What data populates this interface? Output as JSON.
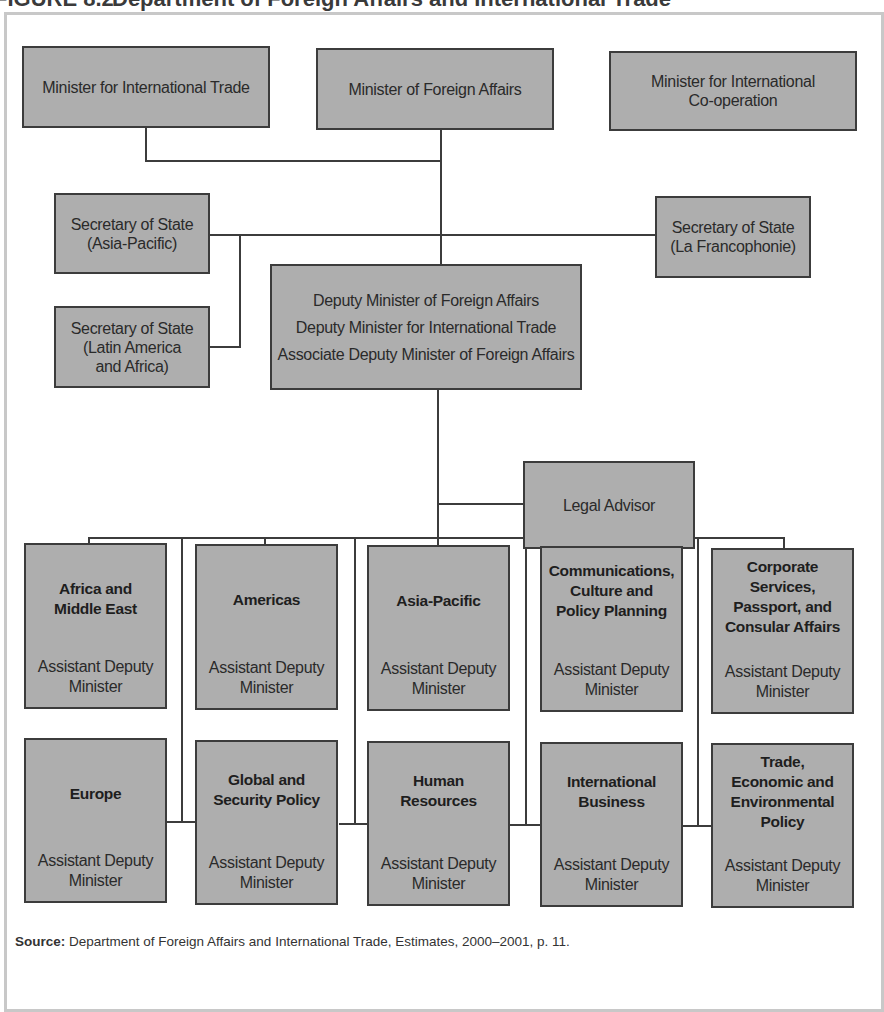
{
  "figure": {
    "number": "FIGURE 8.2",
    "title": "Department of Foreign Affairs and International Trade"
  },
  "ministers": [
    {
      "label": "Minister for International Trade"
    },
    {
      "label": "Minister of Foreign Affairs"
    },
    {
      "label_lines": [
        "Minister for International",
        "Co-operation"
      ]
    }
  ],
  "secretaries": [
    {
      "label_lines": [
        "Secretary of State",
        "(Asia-Pacific)"
      ]
    },
    {
      "label_lines": [
        "Secretary of State",
        "(Latin America",
        "and Africa)"
      ]
    },
    {
      "label_lines": [
        "Secretary of State",
        "(La Francophonie)"
      ]
    }
  ],
  "deputy_ministers": {
    "lines": [
      "Deputy Minister of Foreign Affairs",
      "Deputy Minister for International Trade",
      "Associate Deputy Minister of Foreign Affairs"
    ]
  },
  "legal_advisor": {
    "label": "Legal Advisor"
  },
  "branches": {
    "role_lines": [
      "Assistant Deputy",
      "Minister"
    ],
    "top_row": [
      {
        "name_lines": [
          "Africa and",
          "Middle East"
        ]
      },
      {
        "name_lines": [
          "Americas"
        ]
      },
      {
        "name_lines": [
          "Asia-Pacific"
        ]
      },
      {
        "name_lines": [
          "Communications,",
          "Culture and",
          "Policy Planning"
        ]
      },
      {
        "name_lines": [
          "Corporate",
          "Services,",
          "Passport, and",
          "Consular Affairs"
        ]
      }
    ],
    "bottom_row": [
      {
        "name_lines": [
          "Europe"
        ]
      },
      {
        "name_lines": [
          "Global and",
          "Security Policy"
        ]
      },
      {
        "name_lines": [
          "Human",
          "Resources"
        ]
      },
      {
        "name_lines": [
          "International",
          "Business"
        ]
      },
      {
        "name_lines": [
          "Trade,",
          "Economic and",
          "Environmental",
          "Policy"
        ]
      }
    ]
  },
  "source": {
    "label": "Source:",
    "text": " Department of Foreign Affairs and International Trade, Estimates, 2000–2001, p. 11."
  }
}
